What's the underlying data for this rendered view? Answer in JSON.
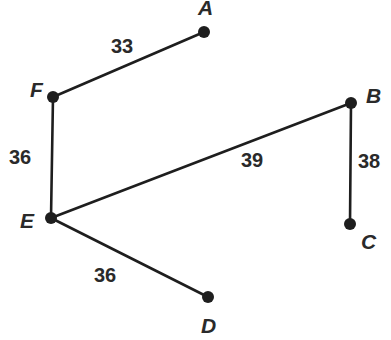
{
  "graph": {
    "nodes": [
      {
        "id": "A",
        "label": "A",
        "x": 204,
        "y": 32,
        "lx": 198,
        "ly": 15
      },
      {
        "id": "F",
        "label": "F",
        "x": 53,
        "y": 97,
        "lx": 30,
        "ly": 97
      },
      {
        "id": "E",
        "label": "E",
        "x": 51,
        "y": 218,
        "lx": 20,
        "ly": 228
      },
      {
        "id": "B",
        "label": "B",
        "x": 351,
        "y": 103,
        "lx": 366,
        "ly": 103
      },
      {
        "id": "C",
        "label": "C",
        "x": 350,
        "y": 224,
        "lx": 361,
        "ly": 249
      },
      {
        "id": "D",
        "label": "D",
        "x": 208,
        "y": 297,
        "lx": 201,
        "ly": 333
      }
    ],
    "edges": [
      {
        "from": "F",
        "to": "A",
        "weight": "33",
        "wx": 111,
        "wy": 53
      },
      {
        "from": "F",
        "to": "E",
        "weight": "36",
        "wx": 9,
        "wy": 164
      },
      {
        "from": "E",
        "to": "B",
        "weight": "39",
        "wx": 241,
        "wy": 167
      },
      {
        "from": "B",
        "to": "C",
        "weight": "38",
        "wx": 358,
        "wy": 168
      },
      {
        "from": "E",
        "to": "D",
        "weight": "36",
        "wx": 94,
        "wy": 282
      }
    ]
  }
}
